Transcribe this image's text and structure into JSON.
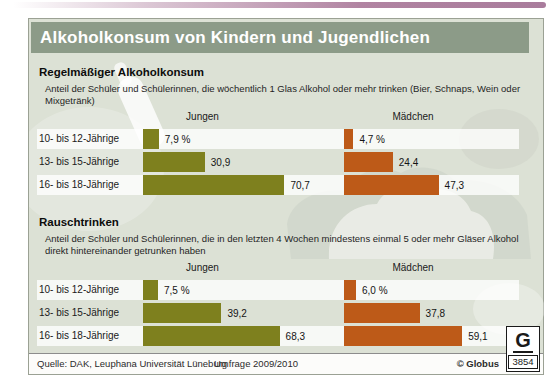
{
  "title": "Alkoholkonsum von Kindern und Jugendlichen",
  "colors": {
    "boys_bar": "#7e801e",
    "girls_bar": "#bd5a18",
    "title_bar_bg": "#8c9b88",
    "card_bg": "#dce1d5",
    "row_stripe": "#f5f6f2",
    "top_strip": "#b184a2"
  },
  "sections": [
    {
      "heading": "Regelmäßiger Alkoholkonsum",
      "subtitle": "Anteil der Schüler und Schülerinnen, die wöchentlich 1 Glas Alkohol oder mehr trinken (Bier, Schnaps, Wein oder Mixgetränk)",
      "columns": {
        "boys": "Jungen",
        "girls": "Mädchen"
      },
      "rows": [
        {
          "label": "10- bis 12-Jährige",
          "boys": 7.9,
          "boys_label": "7,9 %",
          "girls": 4.7,
          "girls_label": "4,7 %"
        },
        {
          "label": "13- bis 15-Jährige",
          "boys": 30.9,
          "boys_label": "30,9",
          "girls": 24.4,
          "girls_label": "24,4"
        },
        {
          "label": "16- bis 18-Jährige",
          "boys": 70.7,
          "boys_label": "70,7",
          "girls": 47.3,
          "girls_label": "47,3"
        }
      ]
    },
    {
      "heading": "Rauschtrinken",
      "subtitle": "Anteil der Schüler und Schülerinnen, die in den letzten 4 Wochen mindestens einmal 5 oder mehr Gläser Alkohol direkt hintereinander getrunken haben",
      "columns": {
        "boys": "Jungen",
        "girls": "Mädchen"
      },
      "rows": [
        {
          "label": "10- bis 12-Jährige",
          "boys": 7.5,
          "boys_label": "7,5 %",
          "girls": 6.0,
          "girls_label": "6,0 %"
        },
        {
          "label": "13- bis 15-Jährige",
          "boys": 39.2,
          "boys_label": "39,2",
          "girls": 37.8,
          "girls_label": "37,8"
        },
        {
          "label": "16- bis 18-Jährige",
          "boys": 68.3,
          "boys_label": "68,3",
          "girls": 59.1,
          "girls_label": "59,1"
        }
      ]
    }
  ],
  "footer": {
    "source": "Quelle: DAK, Leuphana Universität Lüneburg",
    "survey": "Umfrage 2009/2010",
    "copyright": "© Globus",
    "logo_letter": "G",
    "logo_number": "3854"
  },
  "chart_data": [
    {
      "type": "bar",
      "title": "Regelmäßiger Alkoholkonsum",
      "subtitle": "Anteil der Schüler und Schülerinnen, die wöchentlich 1 Glas Alkohol oder mehr trinken (Bier, Schnaps, Wein oder Mixgetränk)",
      "categories": [
        "10- bis 12-Jährige",
        "13- bis 15-Jährige",
        "16- bis 18-Jährige"
      ],
      "series": [
        {
          "name": "Jungen",
          "values": [
            7.9,
            30.9,
            70.7
          ]
        },
        {
          "name": "Mädchen",
          "values": [
            4.7,
            24.4,
            47.3
          ]
        }
      ],
      "unit": "%",
      "xlim": [
        0,
        100
      ],
      "orientation": "horizontal",
      "grid": false,
      "legend_position": "column-headers"
    },
    {
      "type": "bar",
      "title": "Rauschtrinken",
      "subtitle": "Anteil der Schüler und Schülerinnen, die in den letzten 4 Wochen mindestens einmal 5 oder mehr Gläser Alkohol direkt hintereinander getrunken haben",
      "categories": [
        "10- bis 12-Jährige",
        "13- bis 15-Jährige",
        "16- bis 18-Jährige"
      ],
      "series": [
        {
          "name": "Jungen",
          "values": [
            7.5,
            39.2,
            68.3
          ]
        },
        {
          "name": "Mädchen",
          "values": [
            6.0,
            37.8,
            59.1
          ]
        }
      ],
      "unit": "%",
      "xlim": [
        0,
        100
      ],
      "orientation": "horizontal",
      "grid": false,
      "legend_position": "column-headers"
    }
  ]
}
